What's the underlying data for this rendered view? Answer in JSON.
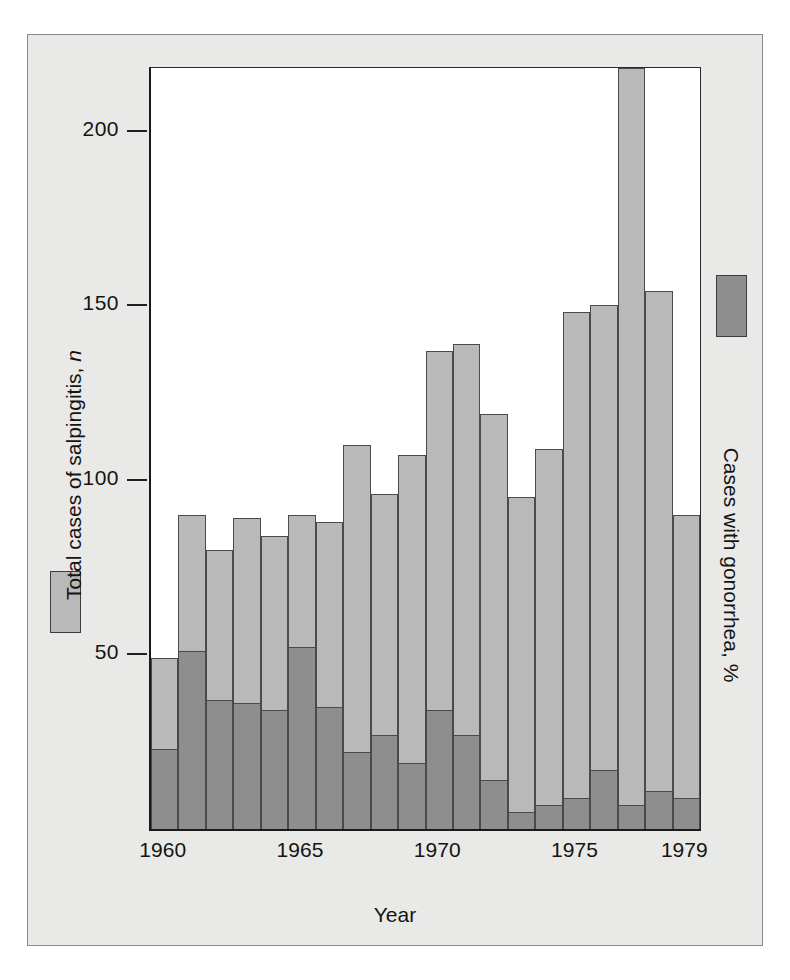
{
  "chart_data": {
    "type": "bar",
    "subtype": "stacked",
    "title": "",
    "xlabel": "Year",
    "ylabel": "Total cases of salpingitis, n",
    "ylabel_italic_suffix": "n",
    "right_label": "Cases with gonorrhea, %",
    "grid": false,
    "legend_position": "left and right margins",
    "ylim": [
      0,
      218
    ],
    "yticks": [
      50,
      100,
      150,
      200
    ],
    "ytick_labels": [
      "50",
      "100",
      "150",
      "200"
    ],
    "xticks": [
      1960,
      1965,
      1970,
      1975,
      1979
    ],
    "xtick_labels": [
      "1960",
      "1965",
      "1970",
      "1975",
      "1979"
    ],
    "categories": [
      "1960",
      "1961",
      "1962",
      "1963",
      "1964",
      "1965",
      "1966",
      "1967",
      "1968",
      "1969",
      "1970",
      "1971",
      "1972",
      "1973",
      "1974",
      "1975",
      "1976",
      "1977",
      "1978",
      "1979"
    ],
    "series": [
      {
        "name": "Total cases of salpingitis, n",
        "color": "#b9b9b9",
        "values": [
          49,
          90,
          80,
          89,
          84,
          90,
          88,
          110,
          96,
          107,
          137,
          139,
          119,
          95,
          109,
          148,
          150,
          218,
          154,
          90
        ]
      },
      {
        "name": "Cases with gonorrhea, %",
        "color": "#8e8e8e",
        "values": [
          23,
          51,
          37,
          36,
          34,
          52,
          35,
          22,
          27,
          19,
          34,
          27,
          14,
          5,
          7,
          9,
          17,
          7,
          11,
          9
        ]
      }
    ],
    "colors": {
      "total_cases": "#b9b9b9",
      "with_gonorrhea": "#8e8e8e",
      "figure_background": "#e9e9e7",
      "plot_background": "#ffffff",
      "axis_line": "#1a1a1a",
      "text": "#141414"
    }
  },
  "legend": {
    "left": {
      "label": "Total cases of salpingitis, n",
      "swatch_color": "#b9b9b9"
    },
    "right": {
      "label": "Cases with gonorrhea, %",
      "swatch_color": "#8e8e8e"
    }
  },
  "axes": {
    "x_title": "Year",
    "y_ticks": [
      {
        "label": "200",
        "value": 200
      },
      {
        "label": "150",
        "value": 150
      },
      {
        "label": "100",
        "value": 100
      },
      {
        "label": "50",
        "value": 50
      }
    ],
    "x_ticks": [
      {
        "label": "1960",
        "value": 1960
      },
      {
        "label": "1965",
        "value": 1965
      },
      {
        "label": "1970",
        "value": 1970
      },
      {
        "label": "1975",
        "value": 1975
      },
      {
        "label": "1979",
        "value": 1979
      }
    ]
  }
}
